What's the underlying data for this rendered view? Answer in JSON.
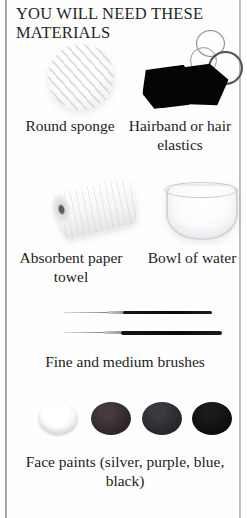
{
  "page": {
    "heading": "YOU WILL NEED THESE MATERIALS",
    "background_color": "#fefefe",
    "text_color": "#1d1d1d",
    "rule_color": "#8d8d8d"
  },
  "materials": [
    {
      "id": "round-sponge",
      "caption": "Round sponge",
      "icon": "round-sponge-icon",
      "color": "#f3f4f5"
    },
    {
      "id": "hairband",
      "caption": "Hairband or hair elastics",
      "icon": "hairband-icon",
      "color": "#050505"
    },
    {
      "id": "paper-towel",
      "caption": "Absorbent paper towel",
      "icon": "paper-towel-roll-icon",
      "color": "#f4f5f6"
    },
    {
      "id": "bowl-of-water",
      "caption": "Bowl of water",
      "icon": "bowl-of-water-icon",
      "color": "#f6f7f8"
    },
    {
      "id": "brushes",
      "caption": "Fine and medium brushes",
      "icon": "paint-brush-icon",
      "color": "#0a0b0e"
    },
    {
      "id": "face-paints",
      "caption": "Face paints (silver, purple, blue, black)",
      "icon": "paint-pot-icon",
      "color": "#1b1b1d"
    }
  ],
  "paint_pots": [
    {
      "name": "silver",
      "color": "#f4f5f6"
    },
    {
      "name": "purple",
      "color": "#302a2f"
    },
    {
      "name": "blue",
      "color": "#282a30"
    },
    {
      "name": "black",
      "color": "#0e0e10"
    }
  ]
}
